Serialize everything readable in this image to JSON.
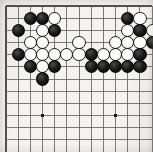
{
  "figure": {
    "kind": "go-board-diagram",
    "game": "Go",
    "title": "",
    "caption": ""
  },
  "board": {
    "visible_columns": 12,
    "visible_rows": 12,
    "line_color": "#6b6b68",
    "background_color": "#f4f3f0",
    "black_color": "#111111",
    "white_color": "#fbfbfa",
    "stone_outline_color": "#1b1b1b",
    "star_point_color": "#1a1a1a",
    "star_points": [
      {
        "col": 3,
        "row": 9
      },
      {
        "col": 9,
        "row": 9
      }
    ]
  },
  "stones": [
    {
      "color": "black",
      "col": 2,
      "row": 1
    },
    {
      "color": "black",
      "col": 3,
      "row": 1
    },
    {
      "color": "white",
      "col": 4,
      "row": 1
    },
    {
      "color": "black",
      "col": 10,
      "row": 1
    },
    {
      "color": "white",
      "col": 11,
      "row": 1
    },
    {
      "color": "black",
      "col": 1,
      "row": 2
    },
    {
      "color": "white",
      "col": 3,
      "row": 2
    },
    {
      "color": "black",
      "col": 4,
      "row": 2
    },
    {
      "color": "white",
      "col": 10,
      "row": 2
    },
    {
      "color": "black",
      "col": 11,
      "row": 2
    },
    {
      "color": "white",
      "col": 12,
      "row": 2
    },
    {
      "color": "white",
      "col": 2,
      "row": 3
    },
    {
      "color": "white",
      "col": 3,
      "row": 3
    },
    {
      "color": "white",
      "col": 6,
      "row": 3
    },
    {
      "color": "white",
      "col": 9,
      "row": 3
    },
    {
      "color": "white",
      "col": 10,
      "row": 3
    },
    {
      "color": "white",
      "col": 11,
      "row": 3
    },
    {
      "color": "black",
      "col": 12,
      "row": 3
    },
    {
      "color": "black",
      "col": 1,
      "row": 4
    },
    {
      "color": "white",
      "col": 2,
      "row": 4
    },
    {
      "color": "white",
      "col": 3,
      "row": 4
    },
    {
      "color": "white",
      "col": 4,
      "row": 4
    },
    {
      "color": "white",
      "col": 5,
      "row": 4
    },
    {
      "color": "white",
      "col": 6,
      "row": 4
    },
    {
      "color": "black",
      "col": 7,
      "row": 4
    },
    {
      "color": "white",
      "col": 8,
      "row": 4
    },
    {
      "color": "white",
      "col": 9,
      "row": 4
    },
    {
      "color": "white",
      "col": 10,
      "row": 4
    },
    {
      "color": "black",
      "col": 11,
      "row": 4
    },
    {
      "color": "black",
      "col": 2,
      "row": 5
    },
    {
      "color": "white",
      "col": 3,
      "row": 5
    },
    {
      "color": "black",
      "col": 4,
      "row": 5
    },
    {
      "color": "black",
      "col": 7,
      "row": 5
    },
    {
      "color": "black",
      "col": 8,
      "row": 5
    },
    {
      "color": "black",
      "col": 9,
      "row": 5
    },
    {
      "color": "black",
      "col": 10,
      "row": 5
    },
    {
      "color": "black",
      "col": 11,
      "row": 5
    },
    {
      "color": "black",
      "col": 3,
      "row": 6
    }
  ]
}
